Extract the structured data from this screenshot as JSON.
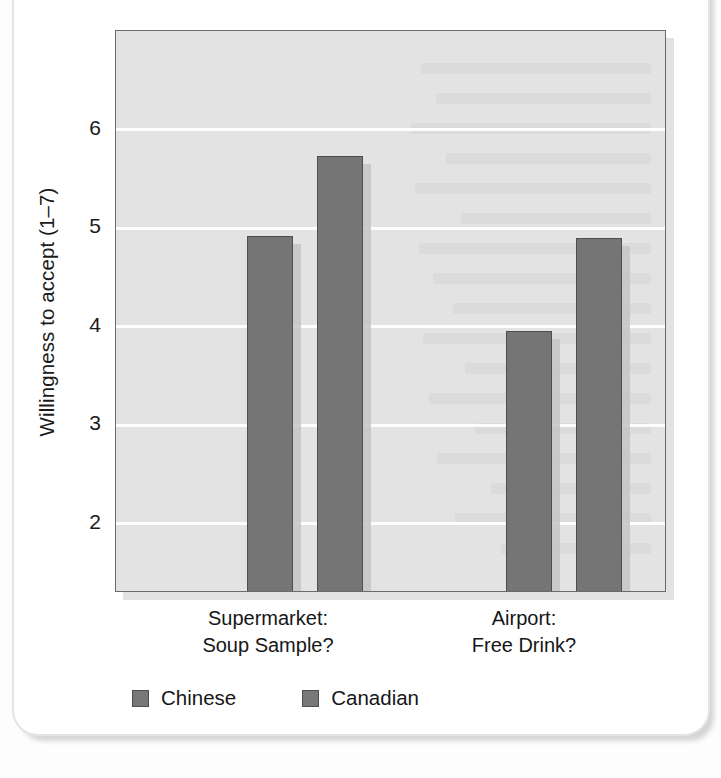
{
  "card": {
    "speck_name": "page-speck"
  },
  "chart_data": {
    "type": "bar",
    "title": "",
    "subtitle": "",
    "xlabel": "",
    "ylabel": "Willingness to accept (1–7)",
    "categories": [
      "Supermarket:\nSoup Sample?",
      "Airport:\nFree Drink?"
    ],
    "category_lines": [
      [
        "Supermarket:",
        "Soup Sample?"
      ],
      [
        "Airport:",
        "Free Drink?"
      ]
    ],
    "series": [
      {
        "name": "Chinese",
        "values": [
          4.92,
          3.96
        ],
        "color": "#757575"
      },
      {
        "name": "Canadian",
        "values": [
          5.73,
          4.9
        ],
        "color": "#757575"
      }
    ],
    "ylim": [
      1.3,
      7.0
    ],
    "yticks": [
      2,
      3,
      4,
      5,
      6
    ],
    "ytick_labels": [
      "2",
      "3",
      "4",
      "5",
      "6"
    ],
    "grid": "horizontal-white",
    "legend_position": "bottom-left",
    "plot_background": "#e3e3e3",
    "bar_outline": "#4e4e4e"
  },
  "legend": {
    "items": [
      {
        "label": "Chinese"
      },
      {
        "label": "Canadian"
      }
    ]
  }
}
